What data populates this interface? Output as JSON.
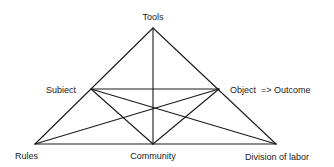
{
  "diagram": {
    "type": "activity-theory-triangle",
    "nodes": {
      "tools": {
        "label": "Tools",
        "x": 153,
        "y": 28
      },
      "subject": {
        "label": "Subiect",
        "x": 91,
        "y": 89
      },
      "object": {
        "label": "Object  => Outcome",
        "x": 219,
        "y": 89
      },
      "rules": {
        "label": "Rules",
        "x": 35,
        "y": 144
      },
      "community": {
        "label": "Community",
        "x": 153,
        "y": 144
      },
      "division": {
        "label": "Division of labor",
        "x": 276,
        "y": 144
      }
    },
    "edges": [
      [
        "tools",
        "rules"
      ],
      [
        "tools",
        "division"
      ],
      [
        "rules",
        "division"
      ],
      [
        "tools",
        "community"
      ],
      [
        "subject",
        "object"
      ],
      [
        "subject",
        "community"
      ],
      [
        "object",
        "community"
      ],
      [
        "subject",
        "division"
      ],
      [
        "object",
        "rules"
      ]
    ],
    "colors": {
      "line": "#1a1a1a",
      "text": "#1a1a1a",
      "background": "#ffffff"
    }
  }
}
